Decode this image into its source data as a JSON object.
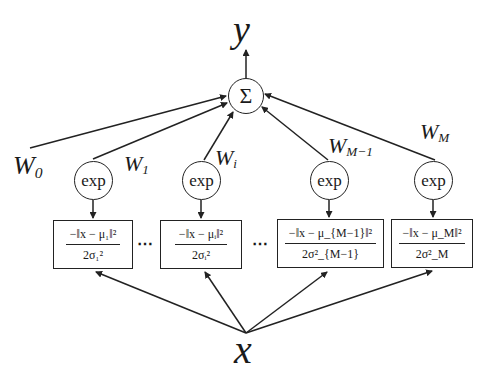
{
  "diagram": {
    "type": "rbf-network",
    "output": {
      "label": "y"
    },
    "sum_node": {
      "symbol": "Σ"
    },
    "input": {
      "label": "x"
    },
    "bias_weight": {
      "label": "W",
      "sub": "0"
    },
    "units": [
      {
        "id": "1",
        "weight": {
          "label": "W",
          "sub": "1"
        },
        "activation": "exp",
        "numerator": "−‖x − μ₁‖²",
        "denominator": "2σ₁²"
      },
      {
        "id": "i",
        "weight": {
          "label": "W",
          "sub": "i"
        },
        "activation": "exp",
        "numerator": "−‖x − μᵢ‖²",
        "denominator": "2σᵢ²"
      },
      {
        "id": "M-1",
        "weight": {
          "label": "W",
          "sub": "M−1"
        },
        "activation": "exp",
        "numerator": "−‖x − μ_{M−1}‖²",
        "denominator": "2σ²_{M−1}"
      },
      {
        "id": "M",
        "weight": {
          "label": "W",
          "sub": "M"
        },
        "activation": "exp",
        "numerator": "−‖x − μ_M‖²",
        "denominator": "2σ²_M"
      }
    ],
    "ellipsis": "⋯",
    "colors": {
      "stroke": "#222222",
      "background": "#ffffff"
    }
  }
}
